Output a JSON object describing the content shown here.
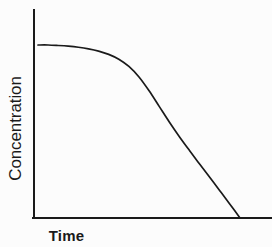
{
  "chart_data": {
    "type": "line",
    "title": "",
    "subtitle": "",
    "xlabel": "Time",
    "ylabel": "Concentration",
    "xticks": [],
    "yticks": [],
    "xticklabels": [],
    "yticklabels": [],
    "grid": false,
    "legend": null,
    "legend_position": "none",
    "annotations": [],
    "axis_style": "open-left-bottom-spines",
    "xlim": [
      0,
      100
    ],
    "ylim": [
      0,
      100
    ],
    "series": [
      {
        "name": "Concentration decay",
        "color": "#1a1a1a",
        "line_width": 1.7,
        "marker": "none",
        "description": "Plateau at maximum concentration, then a sigmoidal roll-off that steepens into a nearly linear decline reaching zero at the right.",
        "x": [
          0,
          5,
          10,
          15,
          20,
          25,
          30,
          35,
          40,
          45,
          50,
          55,
          60,
          65,
          70,
          75,
          80,
          85,
          90,
          95,
          100
        ],
        "y": [
          100,
          100,
          99.7,
          99.3,
          98.7,
          97.8,
          96.5,
          94.6,
          91.8,
          87.6,
          81.5,
          73.5,
          64.5,
          55.5,
          47.0,
          39.0,
          31.2,
          23.5,
          15.8,
          8.0,
          0
        ]
      }
    ],
    "colors": {
      "background": "#fcfcfc",
      "axis": "#1a1a1a",
      "curve": "#1a1a1a",
      "text": "#1a1a1a"
    }
  }
}
